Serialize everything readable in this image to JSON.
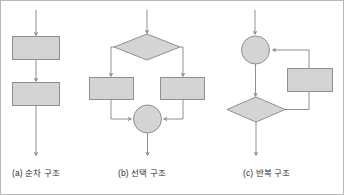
{
  "figure": {
    "title": "",
    "border_color": "#b9b9b9",
    "background": "#ffffff",
    "shape_fill": "#d4d4d4",
    "shape_stroke": "#8f8f8f",
    "connector_color": "#8f8f8f"
  },
  "panels": [
    {
      "id": "a",
      "caption": "(a) 순차 구조",
      "caption_label": "(a)",
      "caption_text": "순차 구조",
      "nodes": [
        {
          "name": "process-1",
          "shape": "rectangle",
          "label": ""
        },
        {
          "name": "process-2",
          "shape": "rectangle",
          "label": ""
        }
      ],
      "edges": [
        {
          "from": "entry",
          "to": "process-1"
        },
        {
          "from": "process-1",
          "to": "process-2"
        },
        {
          "from": "process-2",
          "to": "exit"
        }
      ]
    },
    {
      "id": "b",
      "caption": "(b) 선택 구조",
      "caption_label": "(b)",
      "caption_text": "선택 구조",
      "nodes": [
        {
          "name": "decision",
          "shape": "diamond",
          "label": ""
        },
        {
          "name": "branch-left",
          "shape": "rectangle",
          "label": ""
        },
        {
          "name": "branch-right",
          "shape": "rectangle",
          "label": ""
        },
        {
          "name": "merge",
          "shape": "circle",
          "label": ""
        }
      ],
      "edges": [
        {
          "from": "entry",
          "to": "decision"
        },
        {
          "from": "decision",
          "to": "branch-left"
        },
        {
          "from": "decision",
          "to": "branch-right"
        },
        {
          "from": "branch-left",
          "to": "merge"
        },
        {
          "from": "branch-right",
          "to": "merge"
        },
        {
          "from": "merge",
          "to": "exit"
        }
      ]
    },
    {
      "id": "c",
      "caption": "(c) 반복 구조",
      "caption_label": "(c)",
      "caption_text": "반복 구조",
      "nodes": [
        {
          "name": "loop-junction",
          "shape": "circle",
          "label": ""
        },
        {
          "name": "loop-body",
          "shape": "rectangle",
          "label": ""
        },
        {
          "name": "loop-condition",
          "shape": "diamond",
          "label": ""
        }
      ],
      "edges": [
        {
          "from": "entry",
          "to": "loop-junction"
        },
        {
          "from": "loop-junction",
          "to": "loop-condition"
        },
        {
          "from": "loop-condition",
          "to": "loop-body"
        },
        {
          "from": "loop-body",
          "to": "loop-junction"
        },
        {
          "from": "loop-condition",
          "to": "exit"
        }
      ]
    }
  ]
}
